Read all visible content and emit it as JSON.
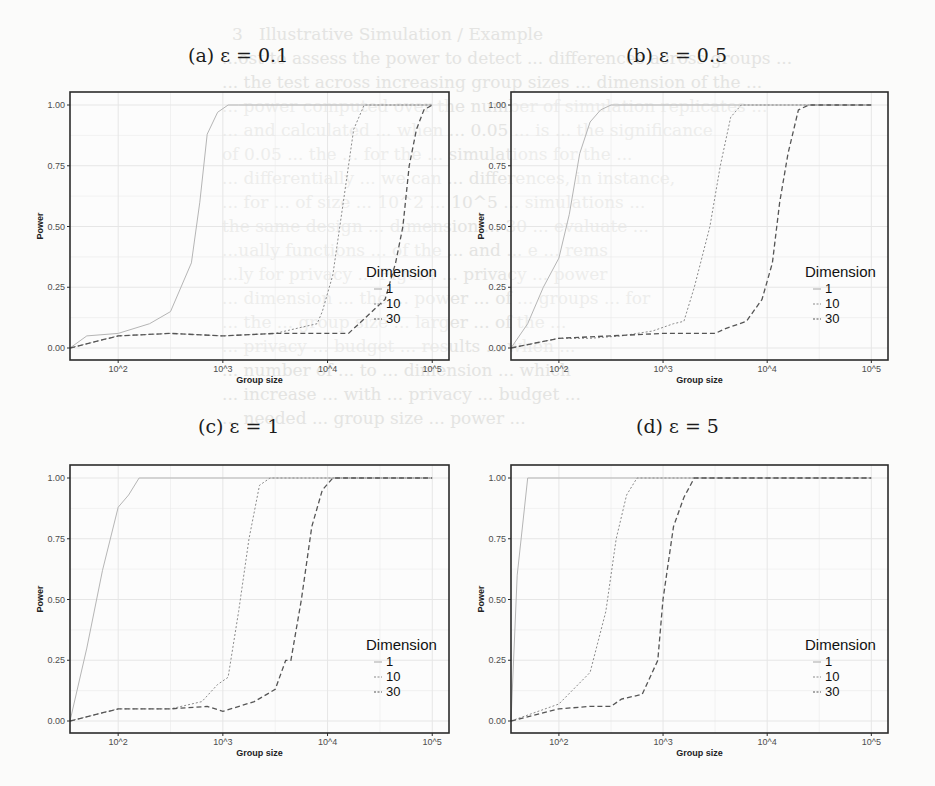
{
  "figure": {
    "bleed_through_lines": [
      "3   Illustrative Simulation / Example",
      "...ost to assess the power to detect ... differences across groups ...",
      "... the test across increasing group sizes ... dimension of the ...",
      "... power computed over the number of simulation replicates ...",
      "... and calculated ... when ... 0.05 ... is ... the significance",
      "of 0.05 ... the ... for the ... simulations for the ...",
      "... differentially ... we can ... differences, in instance,",
      "... for ... of size ... 10^2 ... 10^5 ... simulations ...",
      "the same design ... dimension ... 30 ... evaluate ...",
      "...ually functions ... of the ... and ... e ... rems",
      "...ly for privacy ... Figure ... privacy ... power",
      "... dimension ... the ... power ... of ... groups ... for",
      "... the ... group size ... larger ... of the ...",
      "... privacy ... budget ... results ... when ...",
      "... number of ... to ... dimension ... which",
      "... increase ... with ... privacy ... budget ...",
      "... needed ... group size ... power ..."
    ]
  },
  "chart_data": [
    {
      "type": "line",
      "panel": "a",
      "title": "(a) ε = 0.1",
      "xlabel": "Group size",
      "ylabel": "Power",
      "x_scale": "log10",
      "x_ticks": [
        "10^2",
        "10^3",
        "10^4",
        "10^5"
      ],
      "y_ticks": [
        "0.00",
        "0.25",
        "0.50",
        "0.75",
        "1.00"
      ],
      "ylim": [
        0,
        1
      ],
      "grid": true,
      "legend": {
        "title": "Dimension",
        "position": "inside-bottom-right",
        "entries": [
          "1",
          "10",
          "30"
        ]
      },
      "series": [
        {
          "name": "1",
          "style": "solid",
          "log10x": [
            1.54,
            1.7,
            2.0,
            2.3,
            2.5,
            2.7,
            2.78,
            2.85,
            2.95,
            3.05,
            3.15,
            5.0
          ],
          "y": [
            0.0,
            0.05,
            0.06,
            0.1,
            0.15,
            0.35,
            0.6,
            0.88,
            0.97,
            1.0,
            1.0,
            1.0
          ]
        },
        {
          "name": "10",
          "style": "dotted",
          "log10x": [
            1.54,
            2.0,
            2.5,
            3.0,
            3.5,
            3.8,
            3.9,
            3.95,
            4.05,
            4.15,
            4.25,
            4.35,
            4.45,
            5.0
          ],
          "y": [
            0.0,
            0.05,
            0.06,
            0.05,
            0.06,
            0.09,
            0.1,
            0.15,
            0.3,
            0.6,
            0.9,
            1.0,
            1.0,
            1.0
          ]
        },
        {
          "name": "30",
          "style": "dashed",
          "log10x": [
            1.54,
            2.0,
            2.5,
            3.0,
            3.5,
            4.0,
            4.2,
            4.3,
            4.55,
            4.65,
            4.72,
            4.78,
            4.85,
            4.92,
            5.0
          ],
          "y": [
            0.0,
            0.05,
            0.06,
            0.05,
            0.06,
            0.06,
            0.06,
            0.1,
            0.2,
            0.35,
            0.5,
            0.75,
            0.9,
            0.98,
            1.0
          ]
        }
      ]
    },
    {
      "type": "line",
      "panel": "b",
      "title": "(b) ε = 0.5",
      "xlabel": "Group size",
      "ylabel": "Power",
      "x_scale": "log10",
      "x_ticks": [
        "10^2",
        "10^3",
        "10^4",
        "10^5"
      ],
      "y_ticks": [
        "0.00",
        "0.25",
        "0.50",
        "0.75",
        "1.00"
      ],
      "ylim": [
        0,
        1
      ],
      "grid": true,
      "legend": {
        "title": "Dimension",
        "position": "inside-bottom-right",
        "entries": [
          "1",
          "10",
          "30"
        ]
      },
      "series": [
        {
          "name": "1",
          "style": "solid",
          "log10x": [
            1.54,
            1.7,
            1.85,
            2.0,
            2.1,
            2.2,
            2.3,
            2.4,
            2.5,
            5.0
          ],
          "y": [
            0.0,
            0.1,
            0.25,
            0.37,
            0.55,
            0.8,
            0.93,
            0.98,
            1.0,
            1.0
          ]
        },
        {
          "name": "10",
          "style": "dotted",
          "log10x": [
            1.54,
            2.0,
            2.3,
            2.6,
            2.9,
            3.1,
            3.2,
            3.3,
            3.45,
            3.55,
            3.65,
            3.75,
            5.0
          ],
          "y": [
            0.0,
            0.04,
            0.04,
            0.05,
            0.07,
            0.1,
            0.11,
            0.25,
            0.5,
            0.75,
            0.95,
            1.0,
            1.0
          ]
        },
        {
          "name": "30",
          "style": "dashed",
          "log10x": [
            1.54,
            2.0,
            2.5,
            3.0,
            3.5,
            3.6,
            3.8,
            3.95,
            4.05,
            4.12,
            4.2,
            4.3,
            4.4,
            5.0
          ],
          "y": [
            0.0,
            0.04,
            0.05,
            0.06,
            0.06,
            0.08,
            0.11,
            0.2,
            0.35,
            0.6,
            0.8,
            0.98,
            1.0,
            1.0
          ]
        }
      ]
    },
    {
      "type": "line",
      "panel": "c",
      "title": "(c) ε = 1",
      "xlabel": "Group size",
      "ylabel": "Power",
      "x_scale": "log10",
      "x_ticks": [
        "10^2",
        "10^3",
        "10^4",
        "10^5"
      ],
      "y_ticks": [
        "0.00",
        "0.25",
        "0.50",
        "0.75",
        "1.00"
      ],
      "ylim": [
        0,
        1
      ],
      "grid": true,
      "legend": {
        "title": "Dimension",
        "position": "inside-bottom-right",
        "entries": [
          "1",
          "10",
          "30"
        ]
      },
      "series": [
        {
          "name": "1",
          "style": "solid",
          "log10x": [
            1.54,
            1.7,
            1.85,
            2.0,
            2.1,
            2.2,
            5.0
          ],
          "y": [
            0.0,
            0.3,
            0.62,
            0.88,
            0.93,
            1.0,
            1.0
          ]
        },
        {
          "name": "10",
          "style": "dotted",
          "log10x": [
            1.54,
            2.0,
            2.5,
            2.8,
            2.95,
            3.05,
            3.15,
            3.25,
            3.35,
            3.45,
            3.55,
            5.0
          ],
          "y": [
            0.0,
            0.05,
            0.05,
            0.08,
            0.15,
            0.18,
            0.45,
            0.75,
            0.97,
            1.0,
            1.0,
            1.0
          ]
        },
        {
          "name": "30",
          "style": "dashed",
          "log10x": [
            1.54,
            2.0,
            2.5,
            2.85,
            3.0,
            3.3,
            3.5,
            3.6,
            3.65,
            3.75,
            3.85,
            3.95,
            4.05,
            5.0
          ],
          "y": [
            0.0,
            0.05,
            0.05,
            0.06,
            0.04,
            0.08,
            0.13,
            0.25,
            0.25,
            0.5,
            0.8,
            0.95,
            1.0,
            1.0
          ]
        }
      ]
    },
    {
      "type": "line",
      "panel": "d",
      "title": "(d) ε = 5",
      "xlabel": "Group size",
      "ylabel": "Power",
      "x_scale": "log10",
      "x_ticks": [
        "10^2",
        "10^3",
        "10^4",
        "10^5"
      ],
      "y_ticks": [
        "0.00",
        "0.25",
        "0.50",
        "0.75",
        "1.00"
      ],
      "ylim": [
        0,
        1
      ],
      "grid": true,
      "legend": {
        "title": "Dimension",
        "position": "inside-bottom-right",
        "entries": [
          "1",
          "10",
          "30"
        ]
      },
      "series": [
        {
          "name": "1",
          "style": "solid",
          "log10x": [
            1.54,
            1.6,
            1.7,
            5.0
          ],
          "y": [
            0.0,
            0.6,
            1.0,
            1.0
          ]
        },
        {
          "name": "10",
          "style": "dotted",
          "log10x": [
            1.54,
            2.0,
            2.3,
            2.45,
            2.55,
            2.65,
            2.75,
            2.8,
            5.0
          ],
          "y": [
            0.0,
            0.07,
            0.2,
            0.45,
            0.75,
            0.93,
            1.0,
            1.0,
            1.0
          ]
        },
        {
          "name": "30",
          "style": "dashed",
          "log10x": [
            1.54,
            2.0,
            2.3,
            2.5,
            2.6,
            2.8,
            2.95,
            3.0,
            3.1,
            3.2,
            3.3,
            5.0
          ],
          "y": [
            0.0,
            0.05,
            0.06,
            0.06,
            0.09,
            0.11,
            0.25,
            0.5,
            0.8,
            0.92,
            1.0,
            1.0
          ]
        }
      ]
    }
  ],
  "layout": {
    "panels": [
      {
        "id": "a",
        "title_x": 188,
        "title_y": 44,
        "frame": [
          70,
          92,
          449,
          360
        ]
      },
      {
        "id": "b",
        "title_x": 626,
        "title_y": 44,
        "frame": [
          511,
          92,
          888,
          360
        ]
      },
      {
        "id": "c",
        "title_x": 198,
        "title_y": 415,
        "frame": [
          70,
          465,
          449,
          733
        ]
      },
      {
        "id": "d",
        "title_x": 636,
        "title_y": 415,
        "frame": [
          511,
          465,
          888,
          733
        ]
      }
    ],
    "colors": {
      "frame": "#2b2b2b",
      "grid": "#e6e6e6",
      "dim1": "#b5b5b5",
      "dim10": "#8a8a8a",
      "dim30": "#555555"
    }
  }
}
